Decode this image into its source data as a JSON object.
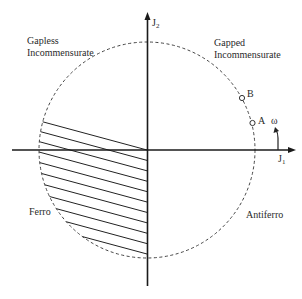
{
  "diagram": {
    "type": "phase-diagram",
    "axes": {
      "x_label": "J",
      "x_label_sub": "1",
      "y_label": "J",
      "y_label_sub": "2"
    },
    "boundary": "unit circle (dashed)",
    "regions": {
      "gapless": {
        "line1": "Gapless",
        "line2": "Incommensurate"
      },
      "gapped": {
        "line1": "Gapped",
        "line2": "Incommensurate"
      },
      "ferro": "Ferro",
      "antiferro": "Antiferro"
    },
    "points": [
      {
        "label": "A"
      },
      {
        "label": "B"
      }
    ],
    "angle_label": "ω",
    "hatched_region": "Ferro (J1<0, below tilted line through origin)"
  }
}
